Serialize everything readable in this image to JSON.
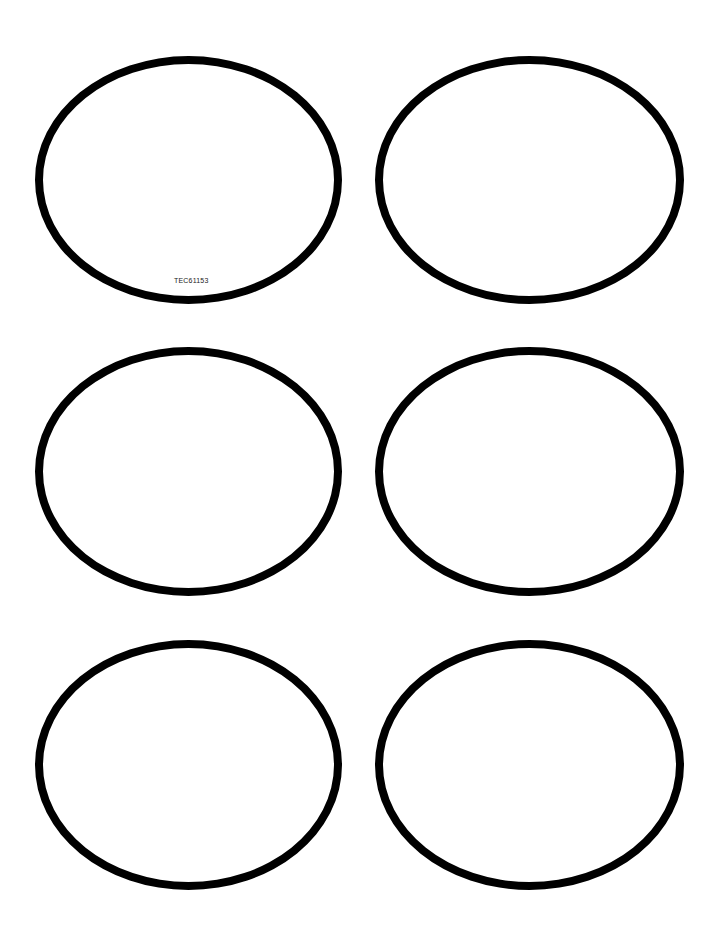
{
  "sheet": {
    "label_code": "TEC61153",
    "ellipse_count": 6,
    "stroke_color": "#000000",
    "background": "#ffffff"
  },
  "ellipses": [
    {
      "name": "top-left",
      "row": 1,
      "col": 1
    },
    {
      "name": "top-right",
      "row": 1,
      "col": 2
    },
    {
      "name": "middle-left",
      "row": 2,
      "col": 1
    },
    {
      "name": "middle-right",
      "row": 2,
      "col": 2
    },
    {
      "name": "bottom-left",
      "row": 3,
      "col": 1
    },
    {
      "name": "bottom-right",
      "row": 3,
      "col": 2
    }
  ]
}
